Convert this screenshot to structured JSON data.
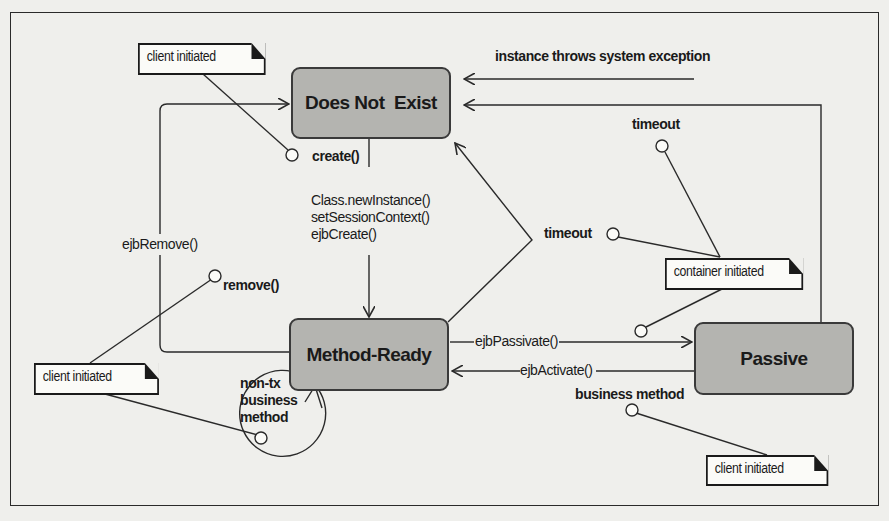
{
  "diagram": {
    "type": "uml-state-diagram",
    "states": [
      {
        "id": "does-not-exist",
        "label": "Does Not  Exist"
      },
      {
        "id": "method-ready",
        "label": "Method-Ready"
      },
      {
        "id": "passive",
        "label": "Passive"
      }
    ],
    "notes": {
      "client_top": "client initiated",
      "client_left": "client initiated",
      "client_bottom_right": "client initiated",
      "container": "container initiated"
    },
    "labels": {
      "create": "create()",
      "create_actions": [
        "Class.newInstance()",
        "setSessionContext()",
        "ejbCreate()"
      ],
      "ejb_remove": "ejbRemove()",
      "remove": "remove()",
      "non_tx": [
        "non-tx",
        "business",
        "method"
      ],
      "system_exception": "instance throws system exception",
      "timeout_top": "timeout",
      "timeout_mid": "timeout",
      "ejb_passivate": "ejbPassivate()",
      "ejb_activate": "ejbActivate()",
      "business_method": "business method"
    },
    "transitions": [
      {
        "from": "does-not-exist",
        "to": "method-ready",
        "trigger": "create()",
        "actions": [
          "Class.newInstance()",
          "setSessionContext()",
          "ejbCreate()"
        ]
      },
      {
        "from": "method-ready",
        "to": "does-not-exist",
        "trigger": "remove()",
        "action": "ejbRemove()"
      },
      {
        "from": "method-ready",
        "to": "does-not-exist",
        "trigger": "timeout"
      },
      {
        "from": "method-ready",
        "to": "method-ready",
        "trigger": "non-tx business method"
      },
      {
        "from": "method-ready",
        "to": "passive",
        "action": "ejbPassivate()"
      },
      {
        "from": "passive",
        "to": "method-ready",
        "trigger": "business method",
        "action": "ejbActivate()"
      },
      {
        "from": "passive",
        "to": "does-not-exist",
        "trigger": "timeout"
      },
      {
        "from": "*",
        "to": "does-not-exist",
        "trigger": "instance throws system exception"
      }
    ],
    "colors": {
      "state_fill": "#b4b4b0",
      "line": "#2a2a2a",
      "background": "#efefec"
    }
  }
}
